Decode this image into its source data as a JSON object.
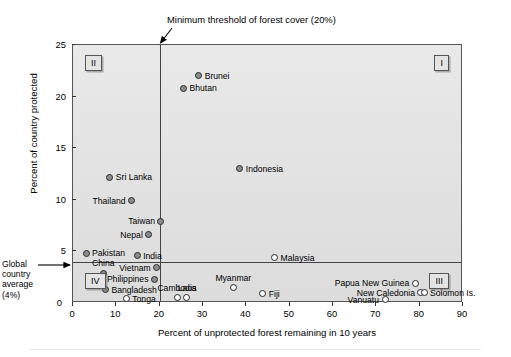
{
  "chart_data": {
    "type": "scatter",
    "title": "",
    "xlabel": "Percent of unprotected forest remaining in 10 years",
    "ylabel": "Percent of country protected",
    "xlim": [
      0,
      90
    ],
    "ylim": [
      0,
      25
    ],
    "xticks": [
      0,
      10,
      20,
      30,
      40,
      50,
      60,
      70,
      80,
      90
    ],
    "yticks": [
      0,
      5,
      10,
      15,
      20,
      25
    ],
    "grid": false,
    "legend": "none",
    "reference_lines": [
      {
        "name": "minimum-threshold-line",
        "orientation": "vertical",
        "value": 20,
        "label": "Minimum threshold of forest cover (20%)"
      },
      {
        "name": "global-average-line",
        "orientation": "horizontal",
        "value": 4,
        "label": "Global country average (4%)"
      }
    ],
    "quadrants": [
      {
        "label": "I",
        "position": "top-right"
      },
      {
        "label": "II",
        "position": "top-left"
      },
      {
        "label": "III",
        "position": "bottom-right"
      },
      {
        "label": "IV",
        "position": "bottom-left"
      }
    ],
    "points": [
      {
        "name": "Brunei",
        "x": 29.0,
        "y": 22.0,
        "label_pos": "r",
        "style": "filled"
      },
      {
        "name": "Bhutan",
        "x": 25.5,
        "y": 20.8,
        "label_pos": "r",
        "style": "filled"
      },
      {
        "name": "Indonesia",
        "x": 38.5,
        "y": 13.0,
        "label_pos": "r",
        "style": "filled"
      },
      {
        "name": "Sri Lanka",
        "x": 8.5,
        "y": 12.2,
        "label_pos": "r",
        "style": "filled"
      },
      {
        "name": "Thailand",
        "x": 13.5,
        "y": 9.9,
        "label_pos": "l",
        "style": "filled"
      },
      {
        "name": "Taiwan",
        "x": 20.3,
        "y": 7.9,
        "label_pos": "l",
        "style": "filled"
      },
      {
        "name": "Nepal",
        "x": 17.5,
        "y": 6.6,
        "label_pos": "l",
        "style": "filled"
      },
      {
        "name": "Pakistan",
        "x": 3.0,
        "y": 4.8,
        "label_pos": "r",
        "style": "filled"
      },
      {
        "name": "India",
        "x": 14.8,
        "y": 4.6,
        "label_pos": "r",
        "style": "filled"
      },
      {
        "name": "Malaysia",
        "x": 46.5,
        "y": 4.4,
        "label_pos": "r",
        "style": "open"
      },
      {
        "name": "Vietnam",
        "x": 19.3,
        "y": 3.4,
        "label_pos": "l",
        "style": "filled"
      },
      {
        "name": "China",
        "x": 7.0,
        "y": 2.9,
        "label_pos": "t",
        "style": "filled"
      },
      {
        "name": "Philippines",
        "x": 18.8,
        "y": 2.3,
        "label_pos": "l",
        "style": "filled"
      },
      {
        "name": "Bangladesh",
        "x": 7.5,
        "y": 1.3,
        "label_pos": "r",
        "style": "filled"
      },
      {
        "name": "Tonga",
        "x": 12.3,
        "y": 0.4,
        "label_pos": "r",
        "style": "open"
      },
      {
        "name": "Cambodia",
        "x": 24.0,
        "y": 0.5,
        "label_pos": "t",
        "style": "open"
      },
      {
        "name": "Laos",
        "x": 26.3,
        "y": 0.5,
        "label_pos": "t",
        "style": "open"
      },
      {
        "name": "Myanmar",
        "x": 37.0,
        "y": 1.5,
        "label_pos": "t",
        "style": "open"
      },
      {
        "name": "Fiji",
        "x": 43.8,
        "y": 0.9,
        "label_pos": "r",
        "style": "open"
      },
      {
        "name": "Papua New Guinea",
        "x": 79.0,
        "y": 1.9,
        "label_pos": "l",
        "style": "open"
      },
      {
        "name": "New Caledonia",
        "x": 80.3,
        "y": 1.0,
        "label_pos": "l",
        "style": "open"
      },
      {
        "name": "Solomon Is.",
        "x": 81.0,
        "y": 1.0,
        "label_pos": "r",
        "style": "open"
      },
      {
        "name": "Vanuatu",
        "x": 72.0,
        "y": 0.3,
        "label_pos": "l",
        "style": "open"
      }
    ]
  },
  "annotations": {
    "threshold_note": "Minimum threshold of forest cover (20%)",
    "global_average_note": "Global\ncountry\naverage\n(4%)"
  }
}
